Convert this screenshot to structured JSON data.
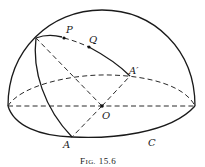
{
  "figure": {
    "caption_prefix": "F",
    "caption_smallcaps": "IG.",
    "caption_number": "15.6",
    "caption_full": "Fig. 15.6"
  },
  "labels": {
    "P": "P",
    "Q": "Q",
    "A_prime": "A′",
    "O": "O",
    "A": "A",
    "C": "C"
  },
  "points": {
    "top_vertex": [
      36,
      38
    ],
    "P": [
      64,
      38
    ],
    "Q": [
      89,
      47
    ],
    "A_prime": [
      130,
      76
    ],
    "O": [
      102,
      106
    ],
    "A": [
      72,
      137
    ]
  },
  "colors": {
    "stroke": "#1a1a1a",
    "background": "#ffffff"
  }
}
